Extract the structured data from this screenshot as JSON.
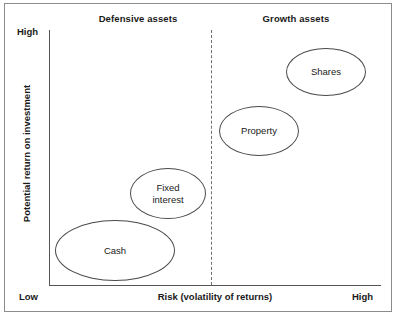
{
  "chart_data": {
    "type": "scatter",
    "title": "",
    "xlabel": "Risk (volatility of returns)",
    "ylabel": "Potential return on investment",
    "x_axis": {
      "label": "Risk (volatility of returns)",
      "min_tick_label": "Low",
      "max_tick_label": "High",
      "range": [
        "Low",
        "High"
      ],
      "grid": false
    },
    "y_axis": {
      "label": "Potential return on investment",
      "min_tick_label": "Low",
      "max_tick_label": "High",
      "range": [
        "Low",
        "High"
      ],
      "grid": false
    },
    "legend": {
      "visible": false,
      "position": "none"
    },
    "regions": [
      {
        "name": "defensive",
        "label": "Defensive assets",
        "side": "left"
      },
      {
        "name": "growth",
        "label": "Growth assets",
        "side": "right"
      }
    ],
    "divider": {
      "orientation": "vertical",
      "style": "dashed",
      "separates": [
        "Defensive assets",
        "Growth assets"
      ]
    },
    "points": [
      {
        "label": "Cash",
        "risk": 0.17,
        "return": 0.11,
        "region": "defensive"
      },
      {
        "label": "Fixed\ninterest",
        "risk": 0.4,
        "return": 0.33,
        "region": "defensive"
      },
      {
        "label": "Property",
        "risk": 0.63,
        "return": 0.59,
        "region": "growth"
      },
      {
        "label": "Shares",
        "risk": 0.83,
        "return": 0.81,
        "region": "growth"
      }
    ],
    "marker_shape": "ellipse",
    "colors": {
      "background": "#ffffff",
      "frame": "#8c8c8c",
      "axis": "#555555",
      "divider": "#6f6f6f",
      "bubble_outline": "#4a4a4a",
      "bubble_fill": "#ffffff",
      "text": "#1a1a1a"
    }
  },
  "headings": {
    "defensive": "Defensive assets",
    "growth": "Growth assets"
  },
  "axes": {
    "y_title": "Potential return on investment",
    "y_high": "High",
    "y_low": "Low",
    "x_title": "Risk (volatility of returns)",
    "x_high": "High"
  },
  "bubbles": {
    "cash": "Cash",
    "fixed_interest": "Fixed\ninterest",
    "property": "Property",
    "shares": "Shares"
  }
}
